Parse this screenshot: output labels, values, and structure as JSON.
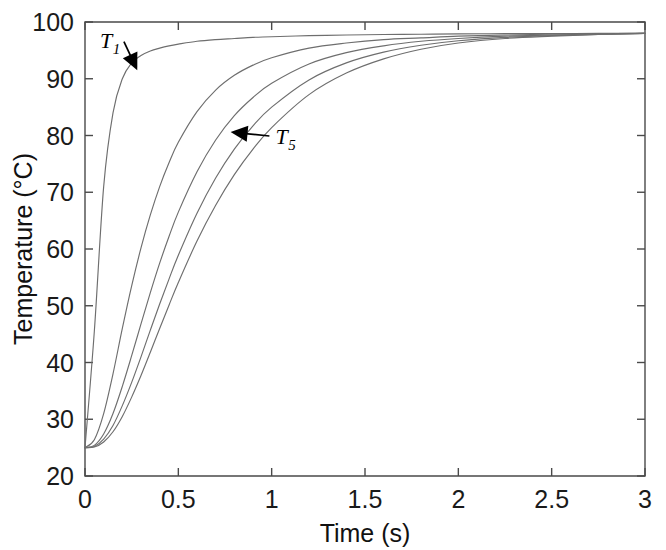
{
  "figure": {
    "background_color": "#ffffff",
    "curve_color": "#6e6e6e",
    "axis_color": "#4a4a4a",
    "annotation_color": "#000000"
  },
  "chart_data": {
    "type": "line",
    "title": "",
    "xlabel": "Time (s)",
    "ylabel": "Temperature (°C)",
    "xlim": [
      0,
      3
    ],
    "ylim": [
      20,
      100
    ],
    "xticks": [
      0,
      0.5,
      1,
      1.5,
      2,
      2.5,
      3
    ],
    "xtick_labels": [
      "0",
      "0.5",
      "1",
      "1.5",
      "2",
      "2.5",
      "3"
    ],
    "yticks": [
      20,
      30,
      40,
      50,
      60,
      70,
      80,
      90,
      100
    ],
    "ytick_labels": [
      "20",
      "30",
      "40",
      "50",
      "60",
      "70",
      "80",
      "90",
      "100"
    ],
    "grid": false,
    "legend_position": "none",
    "tick_direction": "in",
    "frame": "full-box",
    "initial_temperature_c": 25,
    "final_temperature_c": 98,
    "x": [
      0,
      0.05,
      0.1,
      0.15,
      0.2,
      0.25,
      0.3,
      0.35,
      0.4,
      0.45,
      0.5,
      0.6,
      0.7,
      0.8,
      0.9,
      1.0,
      1.2,
      1.4,
      1.6,
      1.8,
      2.0,
      2.25,
      2.5,
      2.75,
      3.0
    ],
    "series": [
      {
        "name": "T1",
        "label": "T₁",
        "values": [
          25.0,
          45.5,
          71.0,
          84.0,
          90.0,
          92.8,
          94.1,
          94.9,
          95.4,
          95.8,
          96.1,
          96.6,
          96.9,
          97.1,
          97.3,
          97.4,
          97.6,
          97.7,
          97.8,
          97.85,
          97.9,
          97.95,
          97.97,
          97.99,
          98.0
        ]
      },
      {
        "name": "T2",
        "label": "T₂",
        "values": [
          25.0,
          26.4,
          31.0,
          38.0,
          46.0,
          53.5,
          60.2,
          66.0,
          71.0,
          75.2,
          78.8,
          84.2,
          88.0,
          90.6,
          92.4,
          93.7,
          95.4,
          96.3,
          96.9,
          97.2,
          97.5,
          97.7,
          97.85,
          97.93,
          98.0
        ]
      },
      {
        "name": "T3",
        "label": "T₃",
        "values": [
          25.0,
          25.4,
          27.4,
          31.0,
          35.8,
          41.2,
          46.8,
          52.3,
          57.5,
          62.2,
          66.5,
          73.6,
          79.2,
          83.5,
          86.7,
          89.2,
          92.6,
          94.6,
          95.8,
          96.6,
          97.1,
          97.5,
          97.7,
          97.9,
          98.0
        ]
      },
      {
        "name": "T4",
        "label": "T₄",
        "values": [
          25.0,
          25.2,
          26.5,
          28.9,
          32.4,
          36.5,
          41.0,
          45.7,
          50.3,
          54.7,
          58.9,
          66.3,
          72.5,
          77.6,
          81.7,
          85.0,
          89.8,
          92.8,
          94.7,
          95.9,
          96.7,
          97.3,
          97.6,
          97.8,
          98.0
        ]
      },
      {
        "name": "T5",
        "label": "T₅",
        "values": [
          25.0,
          25.1,
          26.0,
          27.8,
          30.5,
          33.9,
          37.7,
          41.8,
          46.0,
          50.1,
          54.1,
          61.4,
          67.7,
          73.1,
          77.6,
          81.4,
          87.2,
          91.0,
          93.5,
          95.2,
          96.3,
          97.1,
          97.5,
          97.8,
          98.0
        ]
      }
    ],
    "annotations": [
      {
        "name": "T1",
        "label_main": "T",
        "label_sub": "1",
        "text": "T₁",
        "label_x": 0.08,
        "label_y": 95.5,
        "points_to_x": 0.28,
        "points_to_y": 91.5
      },
      {
        "name": "T5",
        "label_main": "T",
        "label_sub": "5",
        "text": "T₅",
        "label_x": 1.02,
        "label_y": 78.5,
        "points_to_x": 0.78,
        "points_to_y": 80.6
      }
    ]
  }
}
